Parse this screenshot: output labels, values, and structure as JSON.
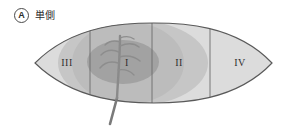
{
  "figure": {
    "panel_letter": "A",
    "caption": "単側",
    "type": "leaf-zone-schematic"
  },
  "diagram": {
    "name": "leaf-zone-diagram",
    "outline": {
      "left_tip_x": 35,
      "right_tip_x": 272,
      "top_y": 23,
      "bottom_y": 103,
      "center_y": 63,
      "stroke_color": "#5a5a5a"
    },
    "shading": {
      "base_fill": "#d8d8d8",
      "mid_fill": "#c3c3c3",
      "inner_fill": "#b0b0b0",
      "core_fill": "#9d9d9d",
      "vein_color": "#8a8a8a",
      "petiole_color": "#7d7d7d"
    },
    "dividers": [
      {
        "name": "divider-III-I",
        "x": 90
      },
      {
        "name": "divider-I-II",
        "x": 152
      },
      {
        "name": "divider-II-IV",
        "x": 210
      }
    ],
    "zones": [
      {
        "id": "zone-3",
        "label": "III",
        "x": 67,
        "y": 63,
        "description": "outer-left-zone"
      },
      {
        "id": "zone-1",
        "label": "I",
        "x": 127,
        "y": 63,
        "description": "central-core-zone"
      },
      {
        "id": "zone-2",
        "label": "II",
        "x": 179,
        "y": 63,
        "description": "inner-right-zone"
      },
      {
        "id": "zone-4",
        "label": "IV",
        "x": 240,
        "y": 63,
        "description": "outer-right-zone"
      }
    ],
    "midrib": {
      "name": "leaf-midrib",
      "top_y": 35,
      "base_x": 117,
      "petiole_tip_x": 108,
      "petiole_tip_y": 125
    }
  }
}
